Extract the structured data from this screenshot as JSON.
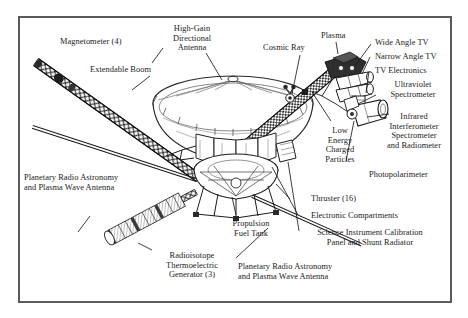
{
  "figure": {
    "frame_color": "#5a5a5e",
    "ink_color": "#1b1b1b",
    "background": "#ffffff"
  },
  "labels": {
    "magnetometer": "Magnetometer (4)",
    "extendable_boom": "Extendable Boom",
    "high_gain_antenna": "High-Gain\nDirectional\nAntenna",
    "cosmic_ray": "Cosmic Ray",
    "plasma": "Plasma",
    "wide_angle_tv": "Wide Angle TV",
    "narrow_angle_tv": "Narrow Angle TV",
    "tv_electronics": "TV Electronics",
    "ultraviolet_spectrometer": "Ultraviolet\nSpectrometer",
    "infrared_instrument": "Infrared\nInterferometer\nSpectrometer\nand Radiometer",
    "photopolarimeter": "Photopolarimeter",
    "low_energy_charged_particles": "Low\nEnergy\nCharged\nParticles",
    "thruster": "Thruster (16)",
    "electronic_compartments": "Electronic Compartments",
    "science_calibration_panel": "Science Instrument Calibration\nPanel and Shunt Radiator",
    "propulsion_fuel_tank": "Propulsion\nFuel Tank",
    "pra_left": "Planetary Radio Astronomy\nand Plasma Wave Antenna",
    "pra_bottom": "Planetary Radio Astronomy\nand Plasma Wave Antenna",
    "rtg": "Radioisotope\nThermoelectric\nGenerator (3)"
  }
}
